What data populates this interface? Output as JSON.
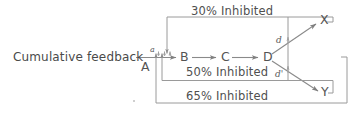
{
  "figure": {
    "type": "pathway-diagram",
    "background_color": "#ffffff",
    "line_color": "#8a8a8a",
    "text_color": "#4a4a4a"
  },
  "labels": {
    "cumulative_feedback": "Cumulative feedback",
    "inhibit_top": "30%  Inhibited",
    "inhibit_middle": "50%  Inhibited",
    "inhibit_bottom": "65%  Inhibited"
  },
  "nodes": [
    {
      "id": "A",
      "label": "A"
    },
    {
      "id": "B",
      "label": "B"
    },
    {
      "id": "C",
      "label": "C"
    },
    {
      "id": "D",
      "label": "D"
    },
    {
      "id": "X",
      "label": "X"
    },
    {
      "id": "Y",
      "label": "Y"
    }
  ],
  "rates": [
    {
      "id": "a",
      "label": "a"
    },
    {
      "id": "d",
      "label": "d"
    },
    {
      "id": "d_prime",
      "label": "d'"
    }
  ],
  "edges": [
    {
      "from": "A",
      "to": "B",
      "rate": "a"
    },
    {
      "from": "B",
      "to": "C",
      "rate": ""
    },
    {
      "from": "C",
      "to": "D",
      "rate": ""
    },
    {
      "from": "D",
      "to": "X",
      "rate": "d"
    },
    {
      "from": "D",
      "to": "Y",
      "rate": "d'"
    }
  ],
  "feedback_loops": [
    {
      "source": "X",
      "target": "A-to-B step",
      "inhibition": "30%  Inhibited"
    },
    {
      "source": "Y",
      "target": "A-to-B step",
      "inhibition": "50%  Inhibited"
    },
    {
      "source": "X and Y",
      "target": "A-to-B step",
      "inhibition": "65%  Inhibited"
    }
  ],
  "inhibition_points": [
    {
      "on_edge": "D-to-X",
      "rate": "d"
    },
    {
      "on_edge": "D-to-Y",
      "rate": "d'"
    }
  ]
}
